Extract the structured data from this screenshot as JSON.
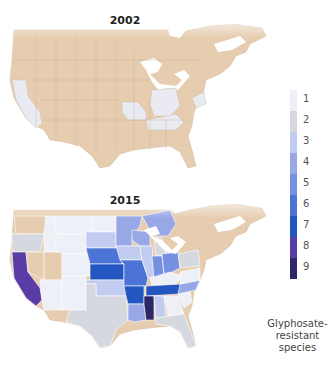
{
  "maps": [
    {
      "title": "2002",
      "default_color": "#e6cdb0",
      "highlighted_regions": [
        {
          "region": "California",
          "value": 1
        },
        {
          "region": "Missouri",
          "value": 1
        },
        {
          "region": "Indiana",
          "value": 1
        },
        {
          "region": "Ohio",
          "value": 1
        },
        {
          "region": "Kentucky",
          "value": 1
        },
        {
          "region": "Tennessee",
          "value": 1
        },
        {
          "region": "Delaware",
          "value": 1
        },
        {
          "region": "Maryland",
          "value": 1
        },
        {
          "region": "New Jersey",
          "value": 1
        }
      ]
    },
    {
      "title": "2015",
      "default_color": "#e6cdb0",
      "highlighted_regions": [
        {
          "region": "California",
          "value": 8
        },
        {
          "region": "Oregon",
          "value": 2
        },
        {
          "region": "Washington",
          "value": 0
        },
        {
          "region": "Nevada",
          "value": 0
        },
        {
          "region": "Utah",
          "value": 0
        },
        {
          "region": "Idaho",
          "value": 1
        },
        {
          "region": "Montana",
          "value": 1
        },
        {
          "region": "Wyoming",
          "value": 1
        },
        {
          "region": "Colorado",
          "value": 1
        },
        {
          "region": "Arizona",
          "value": 1
        },
        {
          "region": "New Mexico",
          "value": 1
        },
        {
          "region": "North Dakota",
          "value": 1
        },
        {
          "region": "South Dakota",
          "value": 3
        },
        {
          "region": "Nebraska",
          "value": 6
        },
        {
          "region": "Kansas",
          "value": 7
        },
        {
          "region": "Oklahoma",
          "value": 3
        },
        {
          "region": "Texas",
          "value": 2
        },
        {
          "region": "Minnesota",
          "value": 4
        },
        {
          "region": "Iowa",
          "value": 3
        },
        {
          "region": "Missouri",
          "value": 6
        },
        {
          "region": "Arkansas",
          "value": 7
        },
        {
          "region": "Louisiana",
          "value": 4
        },
        {
          "region": "Wisconsin",
          "value": 4
        },
        {
          "region": "Illinois",
          "value": 3
        },
        {
          "region": "Michigan",
          "value": 2
        },
        {
          "region": "Indiana",
          "value": 5
        },
        {
          "region": "Ohio",
          "value": 5
        },
        {
          "region": "Kentucky",
          "value": 1
        },
        {
          "region": "Tennessee",
          "value": 7
        },
        {
          "region": "Mississippi",
          "value": 9
        },
        {
          "region": "Alabama",
          "value": 3
        },
        {
          "region": "Georgia",
          "value": 1
        },
        {
          "region": "Florida",
          "value": 2
        },
        {
          "region": "South Carolina",
          "value": 1
        },
        {
          "region": "North Carolina",
          "value": 4
        },
        {
          "region": "Virginia",
          "value": 1
        },
        {
          "region": "Pennsylvania",
          "value": 2
        },
        {
          "region": "Ontario",
          "value": 4
        }
      ]
    }
  ],
  "legend": {
    "caption_lines": [
      "Glyphosate-",
      "resistant",
      "species"
    ],
    "items": [
      {
        "label": "1",
        "color": "#eef0f8"
      },
      {
        "label": "2",
        "color": "#d6d8e0"
      },
      {
        "label": "3",
        "color": "#c2cbf0"
      },
      {
        "label": "4",
        "color": "#98a8e6"
      },
      {
        "label": "5",
        "color": "#7590e0"
      },
      {
        "label": "6",
        "color": "#4b74d6"
      },
      {
        "label": "7",
        "color": "#2456c2"
      },
      {
        "label": "8",
        "color": "#5a3ca6"
      },
      {
        "label": "9",
        "color": "#2c2868"
      }
    ]
  }
}
